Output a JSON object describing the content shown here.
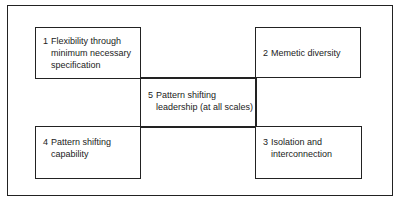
{
  "diagram": {
    "boxes": [
      {
        "id": 1,
        "number": "1",
        "text_lines": [
          "Flexibility through",
          "minimum necessary",
          "specification"
        ]
      },
      {
        "id": 2,
        "number": "2",
        "text_lines": [
          "Memetic diversity"
        ]
      },
      {
        "id": 3,
        "number": "3",
        "text_lines": [
          "Isolation and",
          "interconnection"
        ]
      },
      {
        "id": 4,
        "number": "4",
        "text_lines": [
          "Pattern shifting",
          "capability"
        ]
      },
      {
        "id": 5,
        "number": "5",
        "text_lines": [
          "Pattern shifting",
          "leadership (at all scales)"
        ]
      }
    ]
  }
}
